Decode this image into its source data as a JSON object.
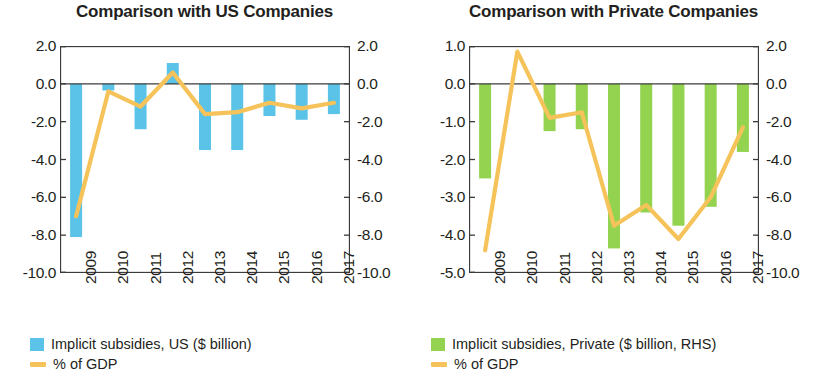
{
  "colors": {
    "bar_us": "#5bc3e8",
    "bar_private": "#93d34f",
    "line": "#f5c35a",
    "axis": "#3b3b3b",
    "text": "#231f20"
  },
  "panels": [
    {
      "id": "us",
      "title": "Comparison with US Companies",
      "y_left_ticks": [
        "2.0",
        "0.0",
        "-2.0",
        "-4.0",
        "-6.0",
        "-8.0",
        "-10.0"
      ],
      "y_right_ticks": [
        "2.0",
        "0.0",
        "-2.0",
        "-4.0",
        "-6.0",
        "-8.0",
        "-10.0"
      ],
      "x_ticks": [
        "2009",
        "2010",
        "2011",
        "2012",
        "2013",
        "2014",
        "2015",
        "2016",
        "2017"
      ],
      "legend": [
        {
          "type": "bar",
          "color": "#5bc3e8",
          "label": "Implicit subsidies, US ($ billion)"
        },
        {
          "type": "line",
          "color": "#f5c35a",
          "label": "% of GDP"
        }
      ]
    },
    {
      "id": "private",
      "title": "Comparison with Private Companies",
      "y_left_ticks": [
        "1.0",
        "0.0",
        "-1.0",
        "-2.0",
        "-3.0",
        "-4.0",
        "-5.0"
      ],
      "y_right_ticks": [
        "2.0",
        "0.0",
        "-2.0",
        "-4.0",
        "-6.0",
        "-8.0",
        "-10.0"
      ],
      "x_ticks": [
        "2009",
        "2010",
        "2011",
        "2012",
        "2013",
        "2014",
        "2015",
        "2016",
        "2017"
      ],
      "legend": [
        {
          "type": "bar",
          "color": "#93d34f",
          "label": "Implicit subsidies, Private ($ billion, RHS)"
        },
        {
          "type": "line",
          "color": "#f5c35a",
          "label": "% of GDP"
        }
      ]
    }
  ],
  "chart_data": [
    {
      "type": "bar",
      "title": "Comparison with US Companies",
      "xlabel": "",
      "ylabel": "",
      "categories": [
        "2009",
        "2010",
        "2011",
        "2012",
        "2013",
        "2014",
        "2015",
        "2016",
        "2017"
      ],
      "ylim": [
        -10.0,
        2.0
      ],
      "y2lim": [
        -10.0,
        2.0
      ],
      "yticks": [
        2.0,
        0.0,
        -2.0,
        -4.0,
        -6.0,
        -8.0,
        -10.0
      ],
      "y2ticks": [
        2.0,
        0.0,
        -2.0,
        -4.0,
        -6.0,
        -8.0,
        -10.0
      ],
      "grid": false,
      "legend_position": "below",
      "series": [
        {
          "name": "Implicit subsidies, US ($ billion)",
          "type": "bar",
          "axis": "left",
          "color": "#5bc3e8",
          "values": [
            -8.1,
            -0.35,
            -2.4,
            1.1,
            -3.5,
            -3.5,
            -1.7,
            -1.9,
            -1.6
          ]
        },
        {
          "name": "% of GDP",
          "type": "line",
          "axis": "right",
          "color": "#f5c35a",
          "values": [
            -7.0,
            -0.4,
            -1.2,
            0.6,
            -1.6,
            -1.5,
            -1.0,
            -1.3,
            -1.0
          ]
        }
      ]
    },
    {
      "type": "bar",
      "title": "Comparison with Private Companies",
      "xlabel": "",
      "ylabel": "",
      "categories": [
        "2009",
        "2010",
        "2011",
        "2012",
        "2013",
        "2014",
        "2015",
        "2016",
        "2017"
      ],
      "ylim": [
        -5.0,
        1.0
      ],
      "y2lim": [
        -10.0,
        2.0
      ],
      "yticks": [
        1.0,
        0.0,
        -1.0,
        -2.0,
        -3.0,
        -4.0,
        -5.0
      ],
      "y2ticks": [
        2.0,
        0.0,
        -2.0,
        -4.0,
        -6.0,
        -8.0,
        -10.0
      ],
      "grid": false,
      "legend_position": "below",
      "series": [
        {
          "name": "Implicit subsidies, Private ($ billion, RHS)",
          "type": "bar",
          "axis": "right",
          "color": "#93d34f",
          "values": [
            -5.0,
            0.0,
            -2.5,
            -2.4,
            -8.7,
            -6.8,
            -7.5,
            -6.5,
            -3.6
          ]
        },
        {
          "name": "% of GDP",
          "type": "line",
          "axis": "left",
          "color": "#f5c35a",
          "values": [
            -4.4,
            0.85,
            -0.9,
            -0.75,
            -3.75,
            -3.2,
            -4.1,
            -3.0,
            -1.15
          ]
        }
      ]
    }
  ]
}
